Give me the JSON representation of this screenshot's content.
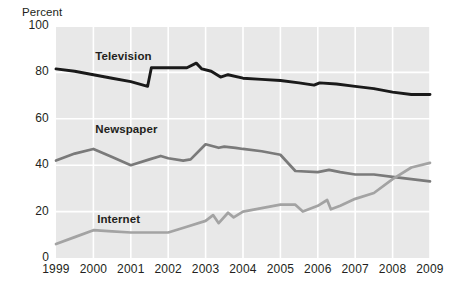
{
  "chart_data": {
    "type": "line",
    "title": "",
    "subtitle": "",
    "xlabel": "",
    "ylabel": "Percent",
    "ylim": [
      0,
      100
    ],
    "xlim": [
      1999,
      2009
    ],
    "yticks": [
      "0",
      "20",
      "40",
      "60",
      "80",
      "100"
    ],
    "ytick_values": [
      0,
      20,
      40,
      60,
      80,
      100
    ],
    "categories": [
      "1999",
      "2000",
      "2001",
      "2002",
      "2003",
      "2004",
      "2005",
      "2006",
      "2007",
      "2008",
      "2009"
    ],
    "grid": true,
    "legend_position": "inline-labels",
    "series": [
      {
        "name": "Television",
        "color": "#1a1a1a",
        "x": [
          1999.0,
          1999.5,
          2000.0,
          2000.5,
          2001.0,
          2001.45,
          2001.55,
          2002.0,
          2002.5,
          2002.75,
          2002.9,
          2003.15,
          2003.4,
          2003.6,
          2004.0,
          2004.5,
          2005.0,
          2005.5,
          2005.9,
          2006.05,
          2006.5,
          2007.0,
          2007.5,
          2008.0,
          2008.5,
          2009.0
        ],
        "values": [
          81.5,
          80.5,
          79.0,
          77.5,
          76.0,
          74.0,
          82.0,
          82.0,
          82.0,
          84.0,
          81.5,
          80.5,
          78.0,
          79.0,
          77.5,
          77.0,
          76.5,
          75.5,
          74.5,
          75.5,
          75.0,
          74.0,
          73.0,
          71.5,
          70.5,
          70.5
        ]
      },
      {
        "name": "Newspaper",
        "color": "#7a7a7a",
        "x": [
          1999.0,
          1999.5,
          2000.0,
          2000.5,
          2001.0,
          2001.5,
          2001.8,
          2002.0,
          2002.4,
          2002.6,
          2003.0,
          2003.35,
          2003.5,
          2003.8,
          2004.0,
          2004.5,
          2005.0,
          2005.4,
          2006.0,
          2006.3,
          2006.6,
          2007.0,
          2007.5,
          2008.0,
          2008.5,
          2009.0
        ],
        "values": [
          42.0,
          45.0,
          47.0,
          43.5,
          40.0,
          42.5,
          44.0,
          43.0,
          42.0,
          42.5,
          49.0,
          47.5,
          48.0,
          47.5,
          47.0,
          46.0,
          44.5,
          37.5,
          37.0,
          38.0,
          37.0,
          36.0,
          36.0,
          35.0,
          34.0,
          33.0
        ]
      },
      {
        "name": "Internet",
        "color": "#a3a3a3",
        "x": [
          1999.0,
          1999.5,
          2000.0,
          2000.5,
          2001.0,
          2001.5,
          2002.0,
          2002.5,
          2003.0,
          2003.2,
          2003.35,
          2003.6,
          2003.75,
          2004.0,
          2004.5,
          2005.0,
          2005.4,
          2005.6,
          2006.0,
          2006.25,
          2006.35,
          2006.6,
          2007.0,
          2007.5,
          2008.0,
          2008.5,
          2009.0
        ],
        "values": [
          6.0,
          9.0,
          12.0,
          11.5,
          11.0,
          11.0,
          11.0,
          13.5,
          16.0,
          18.5,
          15.0,
          19.5,
          17.5,
          20.0,
          21.5,
          23.0,
          23.0,
          20.0,
          22.5,
          25.0,
          21.0,
          22.5,
          25.5,
          28.0,
          34.0,
          39.0,
          41.0
        ]
      }
    ]
  },
  "labels": {
    "y_axis_title": "Percent",
    "television": "Television",
    "newspaper": "Newspaper",
    "internet": "Internet"
  },
  "colors": {
    "plot_background": "#e8e8e8",
    "gridline": "#ffffff",
    "television": "#1a1a1a",
    "newspaper": "#7a7a7a",
    "internet": "#a3a3a3",
    "text": "#231f20"
  }
}
